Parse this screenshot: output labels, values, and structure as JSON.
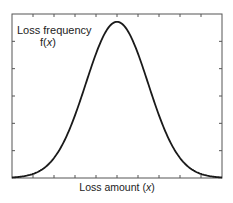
{
  "chart_data": {
    "type": "line",
    "title": "",
    "xlabel": "Loss amount (x)",
    "ylabel": "Loss frequency f(x)",
    "ylabel_line1": "Loss frequency",
    "ylabel_line2_prefix": "f(",
    "ylabel_line2_var": "x",
    "ylabel_line2_suffix": ")",
    "xlabel_prefix": "Loss amount (",
    "xlabel_var": "x",
    "xlabel_suffix": ")",
    "curve": "normal (bell-shaped) density",
    "series": [
      {
        "name": "f(x)",
        "x": [
          0,
          1,
          2,
          3,
          4,
          5,
          6,
          7,
          8,
          9,
          10
        ],
        "values": [
          0.01,
          0.04,
          0.14,
          0.38,
          0.74,
          1.0,
          0.74,
          0.38,
          0.14,
          0.04,
          0.01
        ]
      }
    ],
    "xlim": [
      0,
      10
    ],
    "ylim": [
      0,
      1.05
    ],
    "x_ticks_count": 9,
    "y_ticks_count": 5,
    "tick_labels_shown": false,
    "grid": false,
    "legend": null,
    "colors": {
      "line": "#1a1a1a",
      "frame": "#555555",
      "background": "#ffffff"
    }
  }
}
